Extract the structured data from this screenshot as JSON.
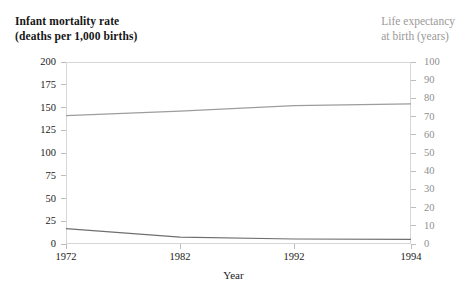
{
  "figure": {
    "left_axis_title_line1": "Infant mortality rate",
    "left_axis_title_line2": "(deaths per 1,000 births)",
    "right_axis_title_line1": "Life expectancy",
    "right_axis_title_line2": "at birth (years)",
    "x_axis_label": "Year",
    "left_axis_color": "#1a1a1a",
    "right_axis_color": "#9a9a9a",
    "frame_color": "#d6d6d6",
    "mortality_line_color": "#6f6f6f",
    "life_expectancy_line_color": "#9d9d9d"
  },
  "chart_data": {
    "type": "line",
    "title": "",
    "subtitle": "",
    "xlabel": "Year",
    "grid": false,
    "legend_position": "none",
    "x": [
      1972,
      1982,
      1992,
      1994
    ],
    "x_tick_labels": [
      "1972",
      "1982",
      "1992",
      "1994"
    ],
    "x_tick_positions_px": [
      66,
      180,
      294,
      411
    ],
    "axes": [
      {
        "id": "left",
        "label_line1": "Infant mortality rate",
        "label_line2": "(deaths per 1,000 births)",
        "ylim": [
          0,
          200
        ],
        "ticks": [
          0,
          25,
          50,
          75,
          100,
          125,
          150,
          175,
          200
        ],
        "tick_labels": [
          "0",
          "25",
          "50",
          "75",
          "100",
          "125",
          "150",
          "175",
          "200"
        ],
        "color": "#1a1a1a"
      },
      {
        "id": "right",
        "label_line1": "Life expectancy",
        "label_line2": "at birth (years)",
        "ylim": [
          0,
          100
        ],
        "ticks": [
          0,
          10,
          20,
          30,
          40,
          50,
          60,
          70,
          80,
          90,
          100
        ],
        "tick_labels": [
          "0",
          "10",
          "20",
          "30",
          "40",
          "50",
          "60",
          "70",
          "80",
          "90",
          "100"
        ],
        "color": "#9a9a9a"
      }
    ],
    "series": [
      {
        "name": "Life expectancy at birth (years)",
        "axis": "right",
        "color": "#9d9d9d",
        "x": [
          1972,
          1982,
          1992,
          1994
        ],
        "values": [
          70.5,
          73.0,
          76.0,
          77.0
        ]
      },
      {
        "name": "Infant mortality rate (deaths per 1,000 births)",
        "axis": "left",
        "color": "#6f6f6f",
        "x": [
          1972,
          1982,
          1992,
          1994
        ],
        "values": [
          17.0,
          7.5,
          5.5,
          5.0
        ]
      }
    ]
  }
}
